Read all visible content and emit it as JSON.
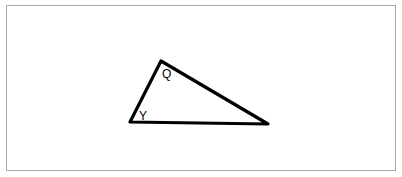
{
  "diagram": {
    "type": "triangle",
    "vertices": [
      {
        "id": "Y",
        "x": 130,
        "y": 122
      },
      {
        "id": "Q",
        "x": 161,
        "y": 61
      },
      {
        "id": "R",
        "x": 268,
        "y": 124
      }
    ],
    "labels": [
      {
        "text": "Q",
        "x": 162,
        "y": 78
      },
      {
        "text": "Y",
        "x": 141,
        "y": 120
      }
    ],
    "stroke_color": "#000000",
    "border_color": "#a8a8a8"
  }
}
